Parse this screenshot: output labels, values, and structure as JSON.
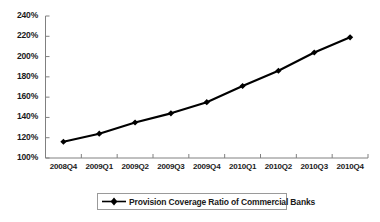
{
  "chart_data": {
    "type": "line",
    "title": "",
    "xlabel": "",
    "ylabel": "",
    "categories": [
      "2008Q4",
      "2009Q1",
      "2009Q2",
      "2009Q3",
      "2009Q4",
      "2010Q1",
      "2010Q2",
      "2010Q3",
      "2010Q4"
    ],
    "series": [
      {
        "name": "Provision Coverage Ratio of Commercial Banks",
        "values": [
          116,
          124,
          135,
          144,
          155,
          171,
          186,
          204,
          219
        ],
        "color": "#000000",
        "marker": "diamond"
      }
    ],
    "ylim": [
      100,
      240
    ],
    "ytick_labels": [
      "100%",
      "120%",
      "140%",
      "160%",
      "180%",
      "200%",
      "220%",
      "240%"
    ],
    "yticks": [
      100,
      120,
      140,
      160,
      180,
      200,
      220,
      240
    ],
    "grid": false,
    "legend_position": "bottom",
    "axis_color": "#808080",
    "unit_suffix": "%"
  },
  "legend": {
    "entry_label": "Provision Coverage Ratio of Commercial Banks"
  }
}
